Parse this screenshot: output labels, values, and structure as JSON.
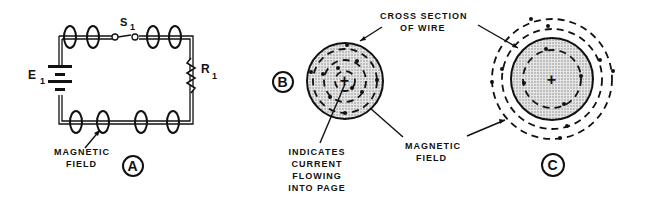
{
  "diagram": {
    "panel_a": {
      "badge": "A",
      "battery_label": "E",
      "battery_subscript": "1",
      "switch_label": "S",
      "switch_subscript": "1",
      "resistor_label": "R",
      "resistor_subscript": "1",
      "field_label_line1": "MAGNETIC",
      "field_label_line2": "FIELD"
    },
    "panel_b": {
      "badge": "B",
      "cross_section_line1": "CROSS SECTION",
      "cross_section_line2": "OF WIRE",
      "current_line1": "INDICATES",
      "current_line2": "CURRENT",
      "current_line3": "FLOWING",
      "current_line4": "INTO PAGE",
      "field_label_line1": "MAGNETIC",
      "field_label_line2": "FIELD",
      "center_symbol": "+"
    },
    "panel_c": {
      "badge": "C",
      "center_symbol": "+"
    },
    "colors": {
      "ink": "#111111",
      "stipple": "#cfcfcf",
      "background": "#ffffff"
    }
  }
}
